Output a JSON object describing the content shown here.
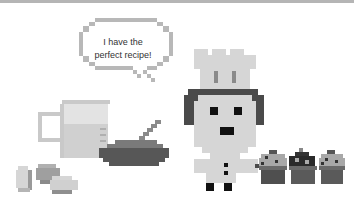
{
  "scene": {
    "description": "Pixel-art cooking scene",
    "speech_bubble": {
      "line1": "I have the",
      "line2": "perfect recipe!"
    },
    "elements": [
      "speech-bubble",
      "measuring-jug",
      "eggs",
      "mixing-bowl",
      "spoon",
      "chef",
      "chef-hat",
      "cupcake-tray",
      "cupcakes"
    ],
    "colors": {
      "background": "#ffffff",
      "border": "#b5b5b5",
      "bubble_outline": "#b8b8b8",
      "light_gray": "#d4d4d4",
      "mid_gray": "#a5a5a5",
      "dark_gray": "#5a5a5a",
      "black": "#111111"
    }
  }
}
